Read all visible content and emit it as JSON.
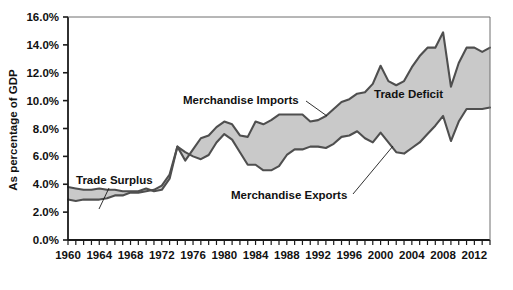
{
  "chart_data": {
    "type": "area",
    "title": "",
    "xlabel": "",
    "ylabel": "As percentage of GDP",
    "xlim": [
      1960,
      2014
    ],
    "ylim": [
      0,
      16
    ],
    "grid": false,
    "legend_position": "inline-annotations",
    "x_tick_labels": [
      "1960",
      "1964",
      "1968",
      "1972",
      "1976",
      "1980",
      "1984",
      "1988",
      "1992",
      "1996",
      "2000",
      "2004",
      "2008",
      "2012"
    ],
    "x_tick_values": [
      1960,
      1964,
      1968,
      1972,
      1976,
      1980,
      1984,
      1988,
      1992,
      1996,
      2000,
      2004,
      2008,
      2012
    ],
    "x_minor_tick_interval": 1,
    "y_tick_labels": [
      "0.0%",
      "2.0%",
      "4.0%",
      "6.0%",
      "8.0%",
      "10.0%",
      "12.0%",
      "14.0%",
      "16.0%"
    ],
    "y_tick_values": [
      0,
      2,
      4,
      6,
      8,
      10,
      12,
      14,
      16
    ],
    "x": [
      1960,
      1961,
      1962,
      1963,
      1964,
      1965,
      1966,
      1967,
      1968,
      1969,
      1970,
      1971,
      1972,
      1973,
      1974,
      1975,
      1976,
      1977,
      1978,
      1979,
      1980,
      1981,
      1982,
      1983,
      1984,
      1985,
      1986,
      1987,
      1988,
      1989,
      1990,
      1991,
      1992,
      1993,
      1994,
      1995,
      1996,
      1997,
      1998,
      1999,
      2000,
      2001,
      2002,
      2003,
      2004,
      2005,
      2006,
      2007,
      2008,
      2009,
      2010,
      2011,
      2012,
      2013,
      2014
    ],
    "series": [
      {
        "name": "Merchandise Exports",
        "values": [
          3.8,
          3.7,
          3.6,
          3.6,
          3.7,
          3.6,
          3.6,
          3.5,
          3.5,
          3.5,
          3.7,
          3.5,
          3.6,
          4.4,
          6.7,
          6.3,
          6.0,
          5.8,
          6.1,
          7.0,
          7.6,
          7.2,
          6.3,
          5.4,
          5.4,
          5.0,
          5.0,
          5.3,
          6.1,
          6.5,
          6.5,
          6.7,
          6.7,
          6.6,
          6.9,
          7.4,
          7.5,
          7.8,
          7.3,
          7.0,
          7.7,
          7.0,
          6.3,
          6.2,
          6.6,
          7.0,
          7.6,
          8.2,
          8.9,
          7.1,
          8.5,
          9.4,
          9.4,
          9.4,
          9.5
        ]
      },
      {
        "name": "Merchandise Imports",
        "values": [
          2.9,
          2.8,
          2.9,
          2.9,
          2.9,
          3.0,
          3.2,
          3.2,
          3.4,
          3.4,
          3.5,
          3.6,
          3.9,
          4.7,
          6.7,
          5.7,
          6.5,
          7.3,
          7.5,
          8.1,
          8.5,
          8.3,
          7.5,
          7.4,
          8.5,
          8.3,
          8.6,
          9.0,
          9.0,
          9.0,
          9.0,
          8.5,
          8.6,
          8.9,
          9.4,
          9.9,
          10.1,
          10.5,
          10.6,
          11.2,
          12.5,
          11.4,
          11.1,
          11.4,
          12.4,
          13.2,
          13.8,
          13.8,
          14.9,
          11.0,
          12.7,
          13.8,
          13.8,
          13.5,
          13.8
        ]
      }
    ],
    "annotations": [
      {
        "text": "Trade Surplus",
        "region": "1960-1972"
      },
      {
        "text": "Merchandise Imports",
        "region": "upper-series"
      },
      {
        "text": "Merchandise Exports",
        "region": "lower-series"
      },
      {
        "text": "Trade Deficit",
        "region": "1976-2014"
      }
    ],
    "colors": {
      "fill": "#c9c9c9",
      "line": "#4f4f4f",
      "axis": "#1a1a1a",
      "background": "#ffffff"
    }
  },
  "axis": {
    "y_title": "As percentage of GDP"
  },
  "annotations": {
    "trade_surplus": "Trade Surplus",
    "merchandise_imports": "Merchandise Imports",
    "merchandise_exports": "Merchandise Exports",
    "trade_deficit": "Trade Deficit"
  }
}
